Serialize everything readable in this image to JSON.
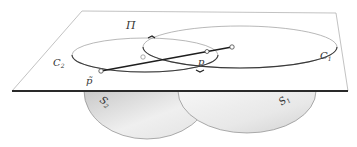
{
  "figure": {
    "type": "geometric-diagram"
  },
  "labels": {
    "plane": "Π",
    "curve_left": "C",
    "curve_left_sub": "2",
    "curve_right": "C",
    "curve_right_sub": "1",
    "point_p": "p",
    "point_p_tilde": "p̃",
    "sphere_left": "S",
    "sphere_left_sub": "2",
    "sphere_right": "S",
    "sphere_right_sub": "1"
  },
  "colors": {
    "plane_edge": "#9a9a9a",
    "plane_front_edge": "#2a2a2a",
    "curve": "#3a3a3a",
    "segment": "#1e1e1e",
    "sphere_fill_light": "#f4f4f4",
    "sphere_fill_dark": "#d6d6d6",
    "sphere_edge": "#8a8a8a"
  }
}
